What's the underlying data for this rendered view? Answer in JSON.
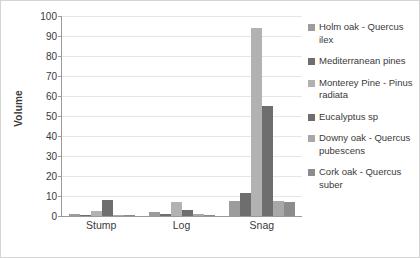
{
  "chart_data": {
    "type": "bar",
    "title": "",
    "xlabel": "",
    "ylabel": "Volume",
    "categories": [
      "Stump",
      "Log",
      "Snag"
    ],
    "ylim": [
      0,
      100
    ],
    "yticks": [
      0,
      10,
      20,
      30,
      40,
      50,
      60,
      70,
      80,
      90,
      100
    ],
    "grid": true,
    "legend_position": "right",
    "series": [
      {
        "name": "Holm oak - Quercus ilex",
        "color": "#9c9c9c",
        "values": [
          1,
          2,
          7.5
        ]
      },
      {
        "name": "Mediterranean pines",
        "color": "#6e6e6e",
        "values": [
          0.6,
          1,
          11.3
        ]
      },
      {
        "name": "Monterey Pine - Pinus radiata",
        "color": "#b2b2b2",
        "values": [
          2.5,
          6.8,
          94
        ]
      },
      {
        "name": "Eucalyptus sp",
        "color": "#6e6e6e",
        "values": [
          8,
          3.2,
          55
        ]
      },
      {
        "name": "Downy oak - Quercus pubescens",
        "color": "#a8a8a8",
        "values": [
          0.7,
          0.8,
          7.5
        ]
      },
      {
        "name": "Cork oak - Quercus suber",
        "color": "#8c8c8c",
        "values": [
          0.5,
          0.5,
          7
        ]
      }
    ]
  }
}
